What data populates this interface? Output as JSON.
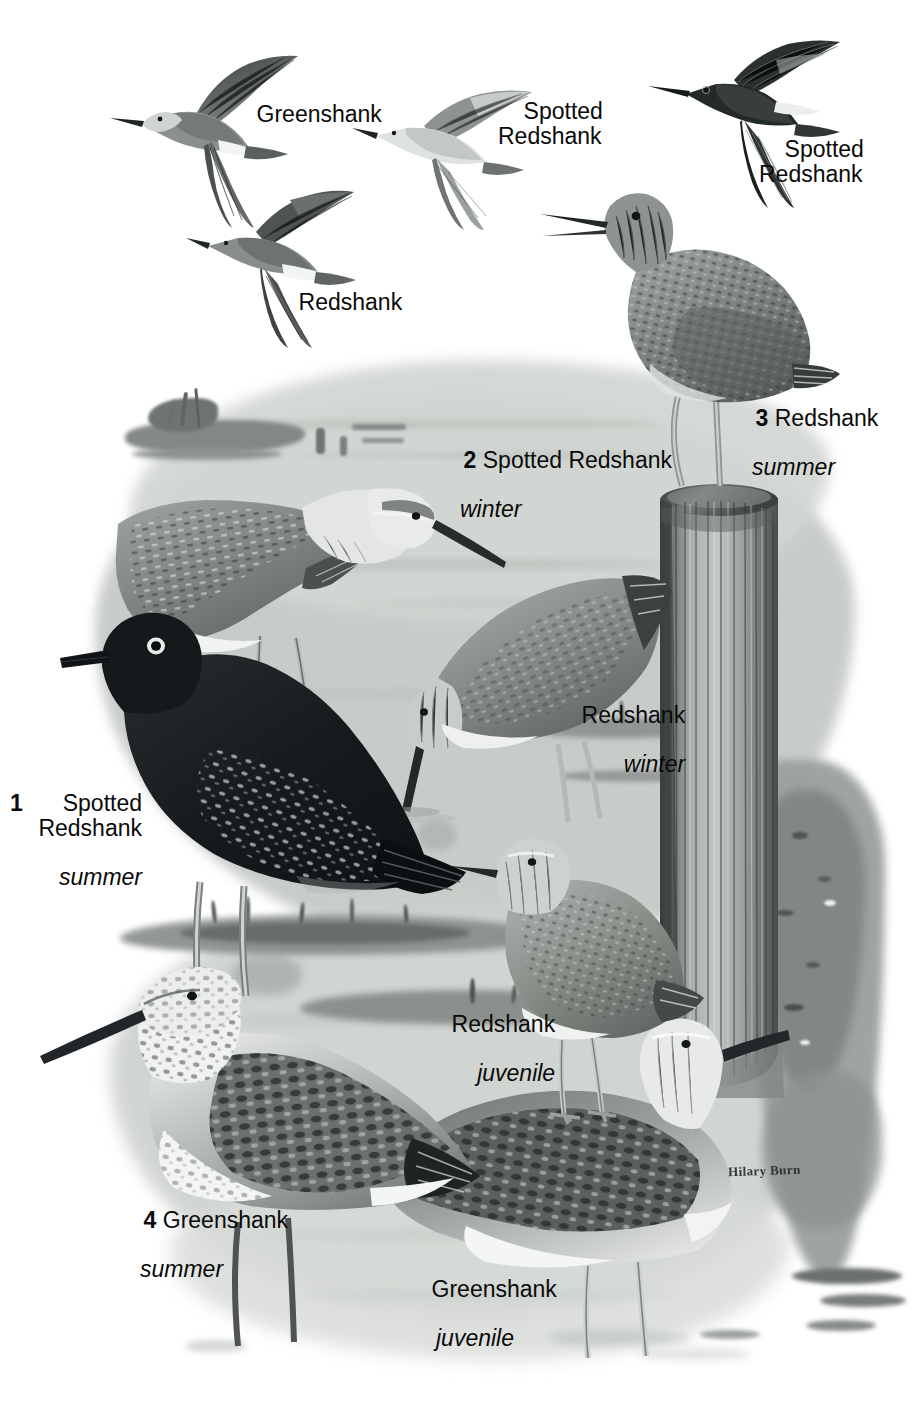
{
  "plate": {
    "title": "Shanks plate — Spotted Redshank, Redshank, Greenshank",
    "signature": "Hilary Burn",
    "background_color": "#ffffff",
    "water_color": "#c9cdc8",
    "ink_color": "#2b2b2b"
  },
  "flight_labels": [
    {
      "id": "flight-greenshank",
      "species": "Greenshank"
    },
    {
      "id": "flight-spotted-redshank-pale",
      "species": "Spotted\nRedshank"
    },
    {
      "id": "flight-redshank",
      "species": "Redshank"
    },
    {
      "id": "flight-spotted-redshank-dark",
      "species": "Spotted\nRedshank"
    }
  ],
  "captions": [
    {
      "id": "caption-1",
      "number": "1",
      "species": "Spotted\nRedshank",
      "age": "summer"
    },
    {
      "id": "caption-2",
      "number": "2",
      "species": "Spotted Redshank",
      "age": "winter"
    },
    {
      "id": "caption-3",
      "number": "3",
      "species": "Redshank",
      "age": "summer"
    },
    {
      "id": "caption-4",
      "number": "4",
      "species": "Greenshank",
      "age": "summer"
    },
    {
      "id": "caption-redshank-winter",
      "number": "",
      "species": "Redshank",
      "age": "winter"
    },
    {
      "id": "caption-redshank-juvenile",
      "number": "",
      "species": "Redshank",
      "age": "juvenile"
    },
    {
      "id": "caption-greenshank-juvenile",
      "number": "",
      "species": "Greenshank",
      "age": "juvenile"
    }
  ],
  "birds": [
    {
      "id": "bird-flight-greenshank",
      "name": "Greenshank",
      "plumage": "flight",
      "posture": "flying"
    },
    {
      "id": "bird-flight-spotted-redshank-winter",
      "name": "Spotted Redshank",
      "plumage": "winter",
      "posture": "flying"
    },
    {
      "id": "bird-flight-redshank",
      "name": "Redshank",
      "plumage": "flight",
      "posture": "flying"
    },
    {
      "id": "bird-flight-spotted-redshank-summer",
      "name": "Spotted Redshank",
      "plumage": "summer",
      "posture": "flying"
    },
    {
      "id": "bird-redshank-summer",
      "name": "Redshank",
      "plumage": "summer",
      "posture": "perched on post"
    },
    {
      "id": "bird-spotted-redshank-winter",
      "name": "Spotted Redshank",
      "plumage": "winter",
      "posture": "standing"
    },
    {
      "id": "bird-spotted-redshank-summer",
      "name": "Spotted Redshank",
      "plumage": "summer",
      "posture": "standing"
    },
    {
      "id": "bird-redshank-winter",
      "name": "Redshank",
      "plumage": "winter",
      "posture": "feeding"
    },
    {
      "id": "bird-redshank-juvenile",
      "name": "Redshank",
      "plumage": "juvenile",
      "posture": "standing"
    },
    {
      "id": "bird-greenshank-summer",
      "name": "Greenshank",
      "plumage": "summer",
      "posture": "standing"
    },
    {
      "id": "bird-greenshank-juvenile",
      "name": "Greenshank",
      "plumage": "juvenile",
      "posture": "standing"
    }
  ],
  "scene": {
    "post_label": "wooden mooring post",
    "bank_label": "muddy bank",
    "water_label": "shallow estuary water"
  }
}
